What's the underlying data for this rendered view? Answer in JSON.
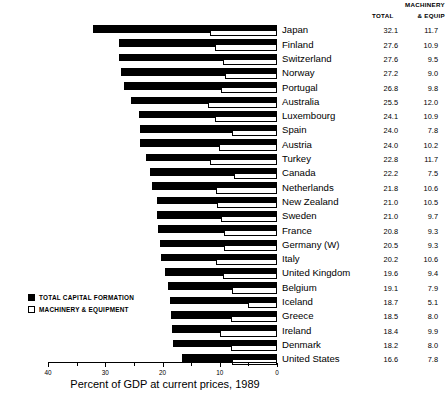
{
  "headers": {
    "machinery": "MACHINERY",
    "total": "TOTAL",
    "equip": "& EQUIP"
  },
  "legend": {
    "total_label": "TOTAL CAPITAL FORMATION",
    "machinery_label": "MACHINERY & EQUIPMENT"
  },
  "axis": {
    "title": "Percent of GDP at current prices, 1989",
    "ticks": [
      "40",
      "30",
      "20",
      "10",
      "0"
    ],
    "min": 0,
    "max": 40,
    "reversed": true
  },
  "chart_data": {
    "type": "bar",
    "orientation": "horizontal",
    "title": "",
    "xlabel": "Percent of GDP at current prices, 1989",
    "ylabel": "",
    "xlim": [
      40,
      0
    ],
    "grid": false,
    "legend_position": "lower-left",
    "categories": [
      "Japan",
      "Finland",
      "Switzerland",
      "Norway",
      "Portugal",
      "Australia",
      "Luxembourg",
      "Spain",
      "Austria",
      "Turkey",
      "Canada",
      "Netherlands",
      "New Zealand",
      "Sweden",
      "France",
      "Germany (W)",
      "Italy",
      "United Kingdom",
      "Belgium",
      "Iceland",
      "Greece",
      "Ireland",
      "Denmark",
      "United States"
    ],
    "series": [
      {
        "name": "TOTAL CAPITAL FORMATION",
        "color": "#000000",
        "values": [
          32.1,
          27.6,
          27.6,
          27.2,
          26.8,
          25.5,
          24.1,
          24.0,
          24.0,
          22.8,
          22.2,
          21.8,
          21.0,
          21.0,
          20.8,
          20.5,
          20.2,
          19.6,
          19.1,
          18.7,
          18.5,
          18.4,
          18.2,
          16.6
        ]
      },
      {
        "name": "MACHINERY & EQUIPMENT",
        "color": "#ffffff",
        "values": [
          11.7,
          10.9,
          9.5,
          9.0,
          9.8,
          12.0,
          10.9,
          7.8,
          10.2,
          11.7,
          7.5,
          10.6,
          10.5,
          9.7,
          9.3,
          9.3,
          10.6,
          9.4,
          7.9,
          5.1,
          8.0,
          9.9,
          8.0,
          7.8
        ]
      }
    ]
  }
}
